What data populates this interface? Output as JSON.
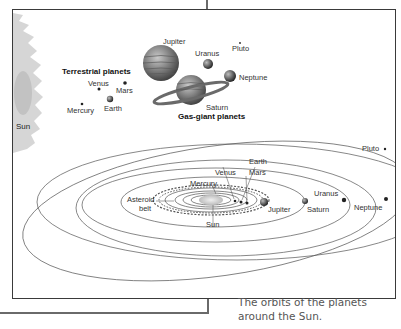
{
  "figure": {
    "caption": "The orbits of the planets around the Sun.",
    "top_panel": {
      "sun_label": "Sun",
      "terrestrial_heading": "Terrestrial planets",
      "terrestrial": [
        {
          "name": "Mercury"
        },
        {
          "name": "Venus"
        },
        {
          "name": "Earth"
        },
        {
          "name": "Mars"
        }
      ],
      "gas_giant_heading": "Gas-giant planets",
      "gas_giants": [
        {
          "name": "Jupiter"
        },
        {
          "name": "Saturn"
        },
        {
          "name": "Uranus"
        },
        {
          "name": "Neptune"
        }
      ],
      "dwarf": {
        "name": "Pluto"
      }
    },
    "orbit_panel": {
      "labels": {
        "sun": "Sun",
        "mercury": "Mercury",
        "venus": "Venus",
        "earth": "Earth",
        "mars": "Mars",
        "asteroid_belt_line1": "Asteroid",
        "asteroid_belt_line2": "belt",
        "jupiter": "Jupiter",
        "saturn": "Saturn",
        "uranus": "Uranus",
        "neptune": "Neptune",
        "pluto": "Pluto"
      }
    },
    "colors": {
      "frame": "#6a6a6a",
      "border": "#3a3a3a",
      "orbit": "#555555",
      "text": "#222222",
      "sun": "#d8d8d8"
    }
  }
}
